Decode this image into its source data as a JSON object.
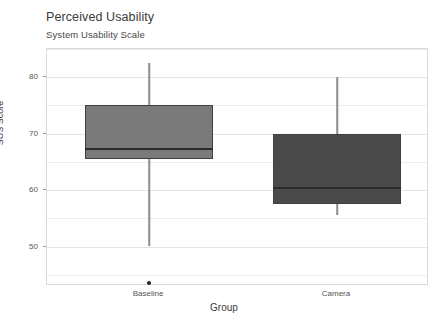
{
  "chart_data": {
    "type": "box",
    "title": "Perceived Usability",
    "subtitle": "System Usability Scale",
    "xlabel": "Group",
    "ylabel": "SUS Score",
    "categories": [
      "Baseline",
      "Camera"
    ],
    "ylim": [
      43,
      85
    ],
    "yticks": [
      50,
      60,
      70,
      80
    ],
    "ytick_labels": [
      "50",
      "60",
      "70",
      "80"
    ],
    "grid": true,
    "legend": "none",
    "boxes": [
      {
        "name": "Baseline",
        "whisker_low": 50.0,
        "q1": 65.5,
        "median": 67.3,
        "q3": 75.0,
        "whisker_high": 82.5,
        "outliers": [
          43.5
        ],
        "fill": "#7a7a7a"
      },
      {
        "name": "Camera",
        "whisker_low": 55.5,
        "q1": 57.5,
        "median": 60.3,
        "q3": 70.0,
        "whisker_high": 80.0,
        "outliers": [],
        "fill": "#4a4a4a"
      }
    ]
  },
  "colors": {
    "baseline_box": "#7a7a7a",
    "camera_box": "#4a4a4a",
    "median": "#2b2b2b",
    "whisker": "#8c8c8c",
    "grid": "#ededed",
    "frame": "#d9d9d9",
    "background": "#ffffff"
  }
}
